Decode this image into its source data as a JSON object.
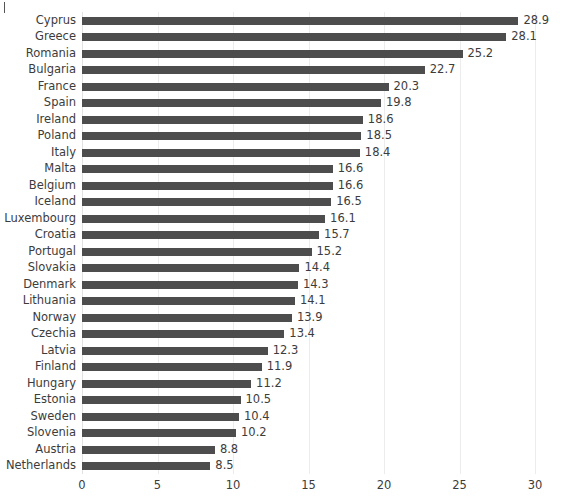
{
  "chart_data": {
    "type": "bar",
    "orientation": "horizontal",
    "title": "",
    "subtitle": "",
    "xlabel": "",
    "ylabel": "",
    "xlim": [
      0,
      30
    ],
    "xticks": [
      "0",
      "5",
      "10",
      "15",
      "20",
      "25",
      "30"
    ],
    "xtick_values": [
      0,
      5,
      10,
      15,
      20,
      25,
      30
    ],
    "grid": "vertical",
    "legend": "none",
    "bar_color": "#4d4d4d",
    "gridline_color": "#ececec",
    "text_color": "#3c3c3c",
    "categories": [
      "Cyprus",
      "Greece",
      "Romania",
      "Bulgaria",
      "France",
      "Spain",
      "Ireland",
      "Poland",
      "Italy",
      "Malta",
      "Belgium",
      "Iceland",
      "Luxembourg",
      "Croatia",
      "Portugal",
      "Slovakia",
      "Denmark",
      "Lithuania",
      "Norway",
      "Czechia",
      "Latvia",
      "Finland",
      "Hungary",
      "Estonia",
      "Sweden",
      "Slovenia",
      "Austria",
      "Netherlands"
    ],
    "values": [
      28.9,
      28.1,
      25.2,
      22.7,
      20.3,
      19.8,
      18.6,
      18.5,
      18.4,
      16.6,
      16.6,
      16.5,
      16.1,
      15.7,
      15.2,
      14.4,
      14.3,
      14.1,
      13.9,
      13.4,
      12.3,
      11.9,
      11.2,
      10.5,
      10.4,
      10.2,
      8.8,
      8.5
    ],
    "value_labels": [
      "28.9",
      "28.1",
      "25.2",
      "22.7",
      "20.3",
      "19.8",
      "18.6",
      "18.5",
      "18.4",
      "16.6",
      "16.6",
      "16.5",
      "16.1",
      "15.7",
      "15.2",
      "14.4",
      "14.3",
      "14.1",
      "13.9",
      "13.4",
      "12.3",
      "11.9",
      "11.2",
      "10.5",
      "10.4",
      "10.2",
      "8.8",
      "8.5"
    ]
  }
}
